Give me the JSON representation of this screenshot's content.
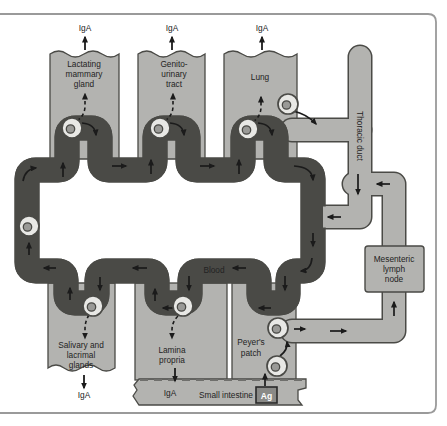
{
  "figure": {
    "title_hint": "Common mucosal immune system circulation diagram",
    "colors": {
      "background": "#ffffff",
      "tissue_gray": "#b3b3b0",
      "vessel_light": "#e8e8e5",
      "outline": "#4a4a46",
      "arrow": "#1b1b1b",
      "frame": "#9a9a9a",
      "nucleus": "#9a9a97",
      "antigen_box_fill": "#8a8a87",
      "antigen_box_border": "#2a2a2a"
    },
    "labels": {
      "iga_mammary": "IgA",
      "iga_genitourinary": "IgA",
      "iga_lung": "IgA",
      "iga_salivary": "IgA",
      "iga_lamina": "IgA",
      "mammary": {
        "lines": [
          "Lactating",
          "mammary",
          "gland"
        ]
      },
      "genitourinary": {
        "lines": [
          "Genito-",
          "urinary",
          "tract"
        ]
      },
      "lung": "Lung",
      "thoracic_duct": "Thoracic duct",
      "blood": "Blood",
      "mesenteric_node": {
        "lines": [
          "Mesenteric",
          "lymph",
          "node"
        ]
      },
      "peyers_patch": {
        "lines": [
          "Peyer's",
          "patch"
        ]
      },
      "salivary": {
        "lines": [
          "Salivary and",
          "lacrimal",
          "glands"
        ]
      },
      "lamina_propria": {
        "lines": [
          "Lamina",
          "propria"
        ]
      },
      "small_intestine": "Small intestine",
      "antigen": "Ag"
    },
    "icons": {
      "cells": "lymphocyte-cell-icon",
      "count_cells": 9
    },
    "flow": {
      "blood_direction": "clockwise",
      "lymph_path": "Peyer's patch > mesenteric lymph node > thoracic duct > blood"
    }
  }
}
